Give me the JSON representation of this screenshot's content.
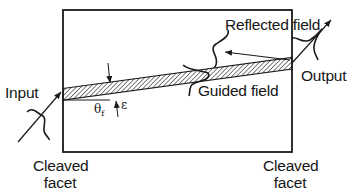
{
  "diagram": {
    "type": "waveguide-cross-section",
    "labels": {
      "input": "Input",
      "output": "Output",
      "reflected_field": "Reflected field",
      "guided_field": "Guided field",
      "cleaved_facet_left_line1": "Cleaved",
      "cleaved_facet_left_line2": "facet",
      "cleaved_facet_right_line1": "Cleaved",
      "cleaved_facet_right_line2": "facet",
      "theta_symbol": "θ",
      "theta_subscript": "f",
      "epsilon_symbol": "ε"
    },
    "colors": {
      "line": "#1a1a1a",
      "background": "#ffffff",
      "hatch": "#1a1a1a"
    }
  }
}
